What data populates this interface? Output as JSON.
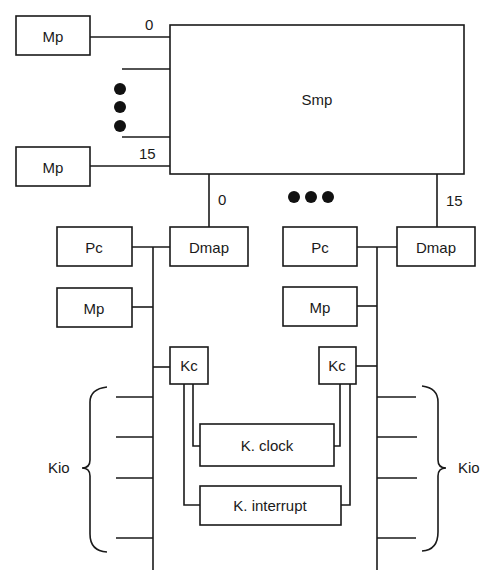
{
  "diagram": {
    "type": "block-diagram",
    "central": {
      "label": "Smp"
    },
    "port_labels": {
      "left_top": "0",
      "left_bottom": "15",
      "bottom_left": "0",
      "bottom_right": "15"
    },
    "left_memories": [
      {
        "label": "Mp"
      },
      {
        "label": "Mp"
      }
    ],
    "clusters": [
      {
        "pc": "Pc",
        "dmap": "Dmap",
        "mp": "Mp",
        "kc": "Kc",
        "kio": "Kio"
      },
      {
        "pc": "Pc",
        "dmap": "Dmap",
        "mp": "Mp",
        "kc": "Kc",
        "kio": "Kio"
      }
    ],
    "shared": {
      "clock": "K. clock",
      "interrupt": "K. interrupt"
    },
    "ellipsis": "●●●"
  }
}
